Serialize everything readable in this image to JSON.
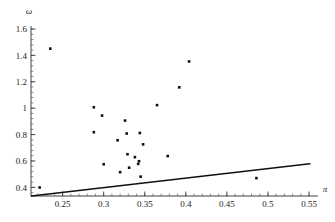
{
  "chart_data": {
    "type": "scatter",
    "title": "",
    "xlabel": "π",
    "ylabel": "ω",
    "xlim": [
      0.21,
      0.56
    ],
    "ylim": [
      0.33,
      1.63
    ],
    "grid": false,
    "legend": null,
    "x_ticks": [
      0.25,
      0.3,
      0.35,
      0.4,
      0.45,
      0.5,
      0.55
    ],
    "x_tick_labels": [
      "0.25",
      "0.3",
      "0.35",
      "0.4",
      "0.45",
      "0.5",
      "0.55"
    ],
    "y_ticks": [
      0.4,
      0.6,
      0.8,
      1,
      1.2,
      1.4,
      1.6
    ],
    "y_tick_labels": [
      "0.4",
      "0.6",
      "0.8",
      "1",
      "1.2",
      "1.4",
      "1.6"
    ],
    "x_minor_step": 0.01,
    "y_minor_step": 0.04,
    "points": [
      {
        "x": 0.222,
        "y": 0.399
      },
      {
        "x": 0.235,
        "y": 1.451
      },
      {
        "x": 0.288,
        "y": 1.007
      },
      {
        "x": 0.288,
        "y": 0.818
      },
      {
        "x": 0.298,
        "y": 0.944
      },
      {
        "x": 0.3,
        "y": 0.575
      },
      {
        "x": 0.317,
        "y": 0.757
      },
      {
        "x": 0.32,
        "y": 0.515
      },
      {
        "x": 0.326,
        "y": 0.906
      },
      {
        "x": 0.328,
        "y": 0.808
      },
      {
        "x": 0.329,
        "y": 0.651
      },
      {
        "x": 0.331,
        "y": 0.549
      },
      {
        "x": 0.338,
        "y": 0.629
      },
      {
        "x": 0.342,
        "y": 0.578
      },
      {
        "x": 0.343,
        "y": 0.598
      },
      {
        "x": 0.344,
        "y": 0.812
      },
      {
        "x": 0.345,
        "y": 0.481
      },
      {
        "x": 0.348,
        "y": 0.726
      },
      {
        "x": 0.365,
        "y": 1.023
      },
      {
        "x": 0.378,
        "y": 0.637
      },
      {
        "x": 0.392,
        "y": 1.158
      },
      {
        "x": 0.404,
        "y": 1.354
      },
      {
        "x": 0.486,
        "y": 0.47
      }
    ],
    "line": {
      "name": "reference-line",
      "x_start": 0.212,
      "y_start": 0.335,
      "x_end": 0.551,
      "y_end": 0.579
    }
  }
}
